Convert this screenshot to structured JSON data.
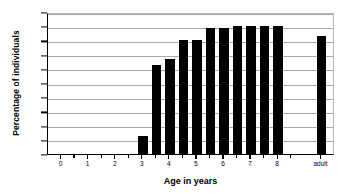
{
  "chart_data": {
    "type": "bar",
    "title": "",
    "xlabel": "Age in years",
    "ylabel": "Percentage of individuals",
    "ylim": [
      0,
      100
    ],
    "ytick_labels": [
      "0",
      "10",
      "20",
      "30",
      "40",
      "50",
      "60",
      "70",
      "80",
      "90",
      "100"
    ],
    "ytick_values": [
      0,
      10,
      20,
      30,
      40,
      50,
      60,
      70,
      80,
      90,
      100
    ],
    "xtick_labels": [
      "0",
      "1",
      "2",
      "3",
      "4",
      "5",
      "6",
      "7",
      "8",
      "adult"
    ],
    "xtick_values": [
      0,
      1,
      2,
      3,
      4,
      5,
      6,
      7,
      8,
      9.6
    ],
    "grid": true,
    "legend": "none",
    "bar_color": "#000000",
    "categories": [
      "0",
      "0.5",
      "1",
      "1.5",
      "2",
      "2.5",
      "3",
      "3.5",
      "4",
      "4.5",
      "5",
      "5.5",
      "6",
      "6.5",
      "7",
      "7.5",
      "8",
      "adult"
    ],
    "x": [
      0,
      0.5,
      1,
      1.5,
      2,
      2.5,
      3,
      3.5,
      4,
      4.5,
      5,
      5.5,
      6,
      6.5,
      7,
      7.5,
      8,
      9.6
    ],
    "values": [
      0,
      0,
      0,
      0,
      0,
      0,
      13,
      63,
      67,
      80,
      80,
      89,
      89,
      90,
      90,
      90,
      90,
      83
    ]
  }
}
